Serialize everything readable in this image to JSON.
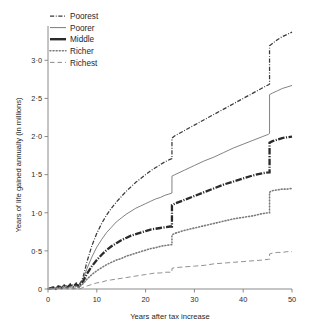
{
  "chart_data": {
    "type": "line",
    "title": "",
    "xlabel": "Years after tax increase",
    "ylabel": "Years of life gained annually (in millions)",
    "xlim": [
      0,
      50
    ],
    "ylim": [
      0,
      3.45
    ],
    "grid": false,
    "legend_position": "top-left",
    "xticks": [
      "0",
      "10",
      "20",
      "30",
      "40",
      "50"
    ],
    "xtick_values": [
      0,
      10,
      20,
      30,
      40,
      50
    ],
    "yticks": [
      "0",
      "0·5",
      "1·0",
      "1·5",
      "2·0",
      "2·5",
      "3·0"
    ],
    "ytick_values": [
      0,
      0.5,
      1.0,
      1.5,
      2.0,
      2.5,
      3.0
    ],
    "series": [
      {
        "name": "Poorest",
        "style": "dash-dot",
        "color": "#3a3a3a",
        "x": [
          0,
          1,
          1.6,
          2.2,
          2.8,
          3.4,
          4,
          4.6,
          5.2,
          5.8,
          6.3,
          6.8,
          7.2,
          7.6,
          8,
          9,
          10,
          11,
          12,
          13,
          14,
          15,
          16,
          17,
          18,
          19,
          20,
          21,
          22,
          23,
          24,
          25,
          25.4,
          25.4,
          26,
          28,
          30,
          32,
          34,
          36,
          38,
          40,
          42,
          44,
          45.2,
          45.4,
          45.4,
          46,
          47,
          48,
          49,
          50
        ],
        "y": [
          0.0,
          0.03,
          0.01,
          0.05,
          0.02,
          0.06,
          0.03,
          0.07,
          0.04,
          0.08,
          0.05,
          0.1,
          0.16,
          0.26,
          0.36,
          0.57,
          0.73,
          0.86,
          0.97,
          1.06,
          1.14,
          1.21,
          1.28,
          1.34,
          1.4,
          1.45,
          1.5,
          1.55,
          1.59,
          1.63,
          1.67,
          1.7,
          1.71,
          1.98,
          2.01,
          2.08,
          2.15,
          2.22,
          2.29,
          2.36,
          2.43,
          2.5,
          2.57,
          2.64,
          2.68,
          2.69,
          3.19,
          3.22,
          3.27,
          3.31,
          3.34,
          3.37
        ]
      },
      {
        "name": "Poorer",
        "style": "solid-thin",
        "color": "#6b6b6b",
        "x": [
          0,
          1,
          1.6,
          2.2,
          2.8,
          3.4,
          4,
          4.6,
          5.2,
          5.8,
          6.3,
          6.8,
          7.2,
          7.6,
          8,
          9,
          10,
          11,
          12,
          13,
          14,
          15,
          16,
          17,
          18,
          19,
          20,
          21,
          22,
          23,
          24,
          25,
          25.4,
          25.4,
          26,
          28,
          30,
          32,
          34,
          36,
          38,
          40,
          42,
          44,
          45.2,
          45.4,
          45.4,
          46,
          47,
          48,
          49,
          50
        ],
        "y": [
          0.0,
          0.02,
          0.01,
          0.04,
          0.02,
          0.05,
          0.03,
          0.06,
          0.03,
          0.07,
          0.04,
          0.09,
          0.13,
          0.2,
          0.27,
          0.42,
          0.55,
          0.65,
          0.74,
          0.81,
          0.88,
          0.93,
          0.98,
          1.02,
          1.06,
          1.09,
          1.12,
          1.15,
          1.18,
          1.2,
          1.23,
          1.25,
          1.26,
          1.48,
          1.5,
          1.56,
          1.62,
          1.68,
          1.73,
          1.79,
          1.85,
          1.9,
          1.95,
          2.0,
          2.03,
          2.04,
          2.55,
          2.57,
          2.6,
          2.63,
          2.65,
          2.67
        ]
      },
      {
        "name": "Middle",
        "style": "thick-dash-dot",
        "color": "#2a2a2a",
        "x": [
          0,
          1,
          1.6,
          2.2,
          2.8,
          3.4,
          4,
          4.6,
          5.2,
          5.8,
          6.3,
          6.8,
          7.2,
          7.6,
          8,
          9,
          10,
          11,
          12,
          13,
          14,
          15,
          16,
          17,
          18,
          19,
          20,
          21,
          22,
          23,
          24,
          25,
          25.4,
          25.4,
          26,
          28,
          30,
          32,
          34,
          36,
          38,
          40,
          42,
          44,
          45.2,
          45.4,
          45.4,
          46,
          47,
          48,
          49,
          50
        ],
        "y": [
          0.0,
          0.02,
          0.0,
          0.03,
          0.01,
          0.04,
          0.02,
          0.05,
          0.02,
          0.06,
          0.03,
          0.07,
          0.1,
          0.15,
          0.2,
          0.3,
          0.38,
          0.45,
          0.51,
          0.56,
          0.6,
          0.64,
          0.67,
          0.7,
          0.72,
          0.74,
          0.76,
          0.78,
          0.79,
          0.8,
          0.81,
          0.82,
          0.82,
          1.1,
          1.12,
          1.17,
          1.22,
          1.27,
          1.32,
          1.37,
          1.41,
          1.45,
          1.49,
          1.52,
          1.53,
          1.53,
          1.92,
          1.94,
          1.96,
          1.98,
          1.99,
          2.0
        ]
      },
      {
        "name": "Richer",
        "style": "dotted",
        "color": "#7a7a7a",
        "x": [
          0,
          1,
          1.6,
          2.2,
          2.8,
          3.4,
          4,
          4.6,
          5.2,
          5.8,
          6.3,
          6.8,
          7.2,
          7.6,
          8,
          9,
          10,
          11,
          12,
          13,
          14,
          15,
          16,
          17,
          18,
          19,
          20,
          21,
          22,
          23,
          24,
          25,
          25.4,
          25.4,
          26,
          28,
          30,
          32,
          34,
          36,
          38,
          40,
          42,
          44,
          45.2,
          45.4,
          45.4,
          46,
          47,
          48,
          49,
          50
        ],
        "y": [
          0.0,
          0.01,
          0.0,
          0.02,
          0.01,
          0.03,
          0.01,
          0.03,
          0.01,
          0.04,
          0.02,
          0.05,
          0.07,
          0.1,
          0.13,
          0.19,
          0.24,
          0.28,
          0.32,
          0.35,
          0.38,
          0.4,
          0.43,
          0.45,
          0.47,
          0.49,
          0.51,
          0.53,
          0.54,
          0.56,
          0.57,
          0.58,
          0.58,
          0.71,
          0.73,
          0.77,
          0.8,
          0.83,
          0.86,
          0.89,
          0.92,
          0.94,
          0.96,
          0.99,
          1.0,
          1.0,
          1.27,
          1.29,
          1.3,
          1.31,
          1.31,
          1.32
        ]
      },
      {
        "name": "Richest",
        "style": "dashed",
        "color": "#8a8a8a",
        "x": [
          0,
          1,
          1.6,
          2.2,
          2.8,
          3.4,
          4,
          4.6,
          5.2,
          5.8,
          6.3,
          6.8,
          7.2,
          7.6,
          8,
          9,
          10,
          11,
          12,
          13,
          14,
          15,
          16,
          17,
          18,
          19,
          20,
          21,
          22,
          23,
          24,
          25,
          25.4,
          25.4,
          26,
          28,
          30,
          32,
          34,
          36,
          38,
          40,
          42,
          44,
          45.2,
          45.4,
          45.4,
          46,
          47,
          48,
          49,
          50
        ],
        "y": [
          0.0,
          0.0,
          0.0,
          0.01,
          0.0,
          0.01,
          0.0,
          0.01,
          0.0,
          0.01,
          0.0,
          0.01,
          0.02,
          0.03,
          0.04,
          0.06,
          0.08,
          0.09,
          0.11,
          0.12,
          0.13,
          0.14,
          0.15,
          0.16,
          0.17,
          0.18,
          0.19,
          0.2,
          0.21,
          0.21,
          0.22,
          0.22,
          0.22,
          0.27,
          0.28,
          0.29,
          0.3,
          0.31,
          0.33,
          0.34,
          0.35,
          0.36,
          0.37,
          0.38,
          0.39,
          0.39,
          0.46,
          0.47,
          0.48,
          0.48,
          0.49,
          0.49
        ]
      }
    ],
    "legend": [
      {
        "label": "Poorest",
        "style": "dash-dot"
      },
      {
        "label": "Poorer",
        "style": "solid-thin"
      },
      {
        "label": "Middle",
        "style": "thick-solid"
      },
      {
        "label": "Richer",
        "style": "dotted"
      },
      {
        "label": "Richest",
        "style": "dashed"
      }
    ]
  }
}
